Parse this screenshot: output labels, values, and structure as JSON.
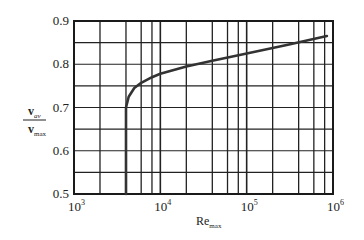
{
  "chart_data": {
    "type": "line",
    "title": "",
    "xlabel": "Re_max",
    "xlabel_main": "Re",
    "xlabel_sub": "max",
    "ylabel": "v_av / v_max",
    "ylabel_num": "v",
    "ylabel_num_sub": "av",
    "ylabel_den": "v",
    "ylabel_den_sub": "max",
    "x_scale": "log",
    "xlim": [
      1000,
      1000000
    ],
    "ylim": [
      0.5,
      0.9
    ],
    "grid": true,
    "x_ticks": [
      {
        "base": "10",
        "exp": "3"
      },
      {
        "base": "10",
        "exp": "4"
      },
      {
        "base": "10",
        "exp": "5"
      },
      {
        "base": "10",
        "exp": "6"
      }
    ],
    "y_ticks": [
      "0.5",
      "0.6",
      "0.7",
      "0.8",
      "0.9"
    ],
    "series": [
      {
        "name": "v_av/v_max",
        "x": [
          4000,
          4000,
          4300,
          5000,
          6000,
          8000,
          10000,
          20000,
          40000,
          100000,
          300000,
          850000
        ],
        "y": [
          0.5,
          0.7,
          0.725,
          0.745,
          0.757,
          0.77,
          0.778,
          0.795,
          0.808,
          0.825,
          0.845,
          0.865
        ]
      }
    ],
    "legend": null
  }
}
